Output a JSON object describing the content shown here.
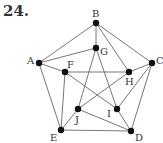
{
  "problem_number": "24.",
  "graph": {
    "nodes": [
      {
        "id": "A",
        "x": 39,
        "y": 63,
        "lx": 27,
        "ly": 64
      },
      {
        "id": "B",
        "x": 96,
        "y": 23,
        "lx": 92,
        "ly": 17
      },
      {
        "id": "C",
        "x": 152,
        "y": 63,
        "lx": 156,
        "ly": 64
      },
      {
        "id": "D",
        "x": 131,
        "y": 131,
        "lx": 135,
        "ly": 141
      },
      {
        "id": "E",
        "x": 61,
        "y": 130,
        "lx": 50,
        "ly": 141
      },
      {
        "id": "F",
        "x": 65,
        "y": 72,
        "lx": 67,
        "ly": 68
      },
      {
        "id": "G",
        "x": 96,
        "y": 48,
        "lx": 100,
        "ly": 55
      },
      {
        "id": "H",
        "x": 129,
        "y": 72,
        "lx": 125,
        "ly": 85
      },
      {
        "id": "I",
        "x": 117,
        "y": 109,
        "lx": 107,
        "ly": 117
      },
      {
        "id": "J",
        "x": 78,
        "y": 109,
        "lx": 75,
        "ly": 123
      }
    ],
    "edges": [
      [
        "A",
        "B"
      ],
      [
        "B",
        "C"
      ],
      [
        "B",
        "G"
      ],
      [
        "B",
        "H"
      ],
      [
        "A",
        "G"
      ],
      [
        "A",
        "F"
      ],
      [
        "A",
        "E"
      ],
      [
        "C",
        "H"
      ],
      [
        "C",
        "D"
      ],
      [
        "C",
        "I"
      ],
      [
        "E",
        "D"
      ],
      [
        "F",
        "H"
      ],
      [
        "F",
        "E"
      ],
      [
        "F",
        "I"
      ],
      [
        "G",
        "J"
      ],
      [
        "G",
        "I"
      ],
      [
        "H",
        "J"
      ],
      [
        "J",
        "E"
      ],
      [
        "J",
        "D"
      ],
      [
        "I",
        "D"
      ]
    ]
  }
}
